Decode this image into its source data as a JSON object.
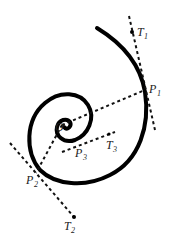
{
  "diagram": {
    "labels": {
      "O": {
        "main": "O",
        "sub": ""
      },
      "P1": {
        "main": "P",
        "sub": "1"
      },
      "T1": {
        "main": "T",
        "sub": "1"
      },
      "P2": {
        "main": "P",
        "sub": "2"
      },
      "T2": {
        "main": "T",
        "sub": "2"
      },
      "P3": {
        "main": "P",
        "sub": "3"
      },
      "T3": {
        "main": "T",
        "sub": "3"
      }
    },
    "colors": {
      "curve": "#000000",
      "lines": "#111111",
      "text": "#222222"
    }
  }
}
